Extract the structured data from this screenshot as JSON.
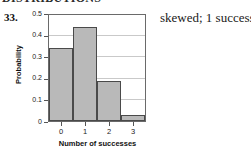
{
  "page": {
    "cut_off_top_text": "DISTRIBUTIONS",
    "item_number": "33.",
    "answer_text": "skewed; 1 success"
  },
  "chart_data": {
    "type": "bar",
    "title": "",
    "xlabel": "Number of successes",
    "ylabel": "Probability",
    "categories": [
      "0",
      "1",
      "2",
      "3"
    ],
    "values": [
      0.345,
      0.445,
      0.19,
      0.03
    ],
    "ylim": [
      0,
      0.5
    ],
    "yticks": [
      "0",
      "0.1",
      "0.2",
      "0.3",
      "0.4",
      "0.5"
    ],
    "ytick_values": [
      0,
      0.1,
      0.2,
      0.3,
      0.4,
      0.5
    ],
    "xticks": [
      "0",
      "1",
      "2",
      "3"
    ],
    "grid": true,
    "legend": "none",
    "bar_fill_color": "#b9b9b9",
    "bar_border_color": "#4a4a4a",
    "gridline_color": "#c9c9c9",
    "axis_color": "#6a6a6a"
  }
}
